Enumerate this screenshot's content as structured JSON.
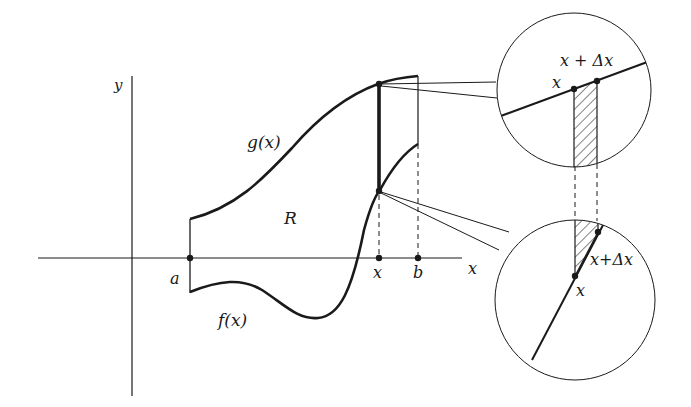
{
  "diagram": {
    "colors": {
      "ink": "#1a1a1a",
      "background": "#ffffff"
    },
    "axes": {
      "x_label": "x",
      "y_label": "y"
    },
    "labels": {
      "a": "a",
      "b": "b",
      "x_point": "x",
      "region": "R",
      "upper_curve": "g(x)",
      "lower_curve": "f(x)"
    },
    "zoom_upper": {
      "x_label": "x",
      "x_dx_label": "x + Δx"
    },
    "zoom_lower": {
      "x_label": "x",
      "x_dx_label": "x+Δx"
    }
  }
}
